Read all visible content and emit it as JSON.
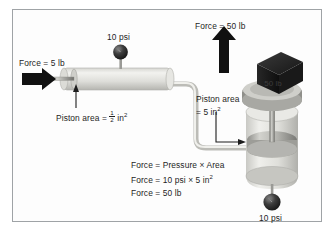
{
  "figure": {
    "border_color": "#9fa3a6",
    "background": "#fdfdfd"
  },
  "labels": {
    "input_force": "Force = 5 lb",
    "small_gauge": "10 psi",
    "small_piston_area_prefix": "Piston area = ",
    "small_piston_area_num": "1",
    "small_piston_area_den": "2",
    "small_piston_area_unit": "in",
    "small_piston_area_exp": "2",
    "output_force": "Force = 50 lb",
    "large_piston_area_line1": "Piston area",
    "large_piston_area_line2_prefix": "= 5 in",
    "large_piston_area_line2_exp": "2",
    "weight_block": "50 lb",
    "bottom_gauge": "10 psi"
  },
  "formula": {
    "line1": "Force = Pressure × Area",
    "line2_prefix": "Force = 10 psi × 5 in",
    "line2_exp": "2",
    "line3": "Force = 50 lb"
  },
  "colors": {
    "arrow": "#111111",
    "cylinder_light": "#e8e8e4",
    "cylinder_mid": "#c9c9c4",
    "cylinder_dark": "#9a9a95",
    "gauge_dark": "#2a2a2a",
    "block_dark": "#1f1f1f",
    "text": "#1d1d1d",
    "tube": "#dcdcd8"
  },
  "icons": {
    "input_arrow": "arrow-right-icon",
    "output_arrow": "arrow-up-icon",
    "pointer_small": "pointer-arrow-icon",
    "pointer_large": "pointer-arrow-icon"
  }
}
